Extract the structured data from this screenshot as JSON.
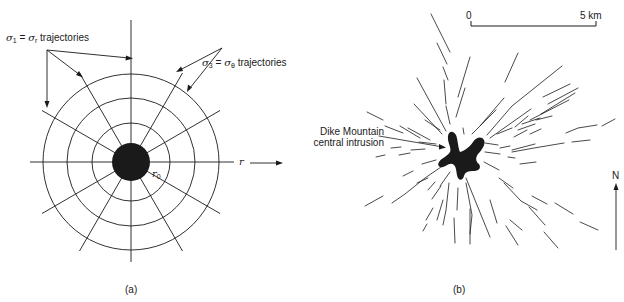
{
  "figure": {
    "panel_a": {
      "caption": "(a)",
      "label_sigma1": {
        "sym1": "σ",
        "sub1": "1",
        "eq": " = ",
        "sym2": "σ",
        "sub2": "r",
        "text": " trajectories"
      },
      "label_sigma3": {
        "sym1": "σ",
        "sub1": "3",
        "eq": " = ",
        "sym2": "σ",
        "sub2": "θ",
        "text": " trajectories"
      },
      "radius_label": {
        "sym": "r",
        "sub": "0"
      },
      "axis_label": "r",
      "geometry": {
        "center": [
          131,
          162
        ],
        "core_radius": 19,
        "circle_radii": [
          39,
          64,
          88
        ],
        "radial_angles_deg": [
          0,
          30,
          60,
          90,
          120,
          150,
          180,
          210,
          240,
          270,
          300,
          330
        ],
        "radial_length": 103
      }
    },
    "panel_b": {
      "caption": "(b)",
      "intrusion_label_line1": "Dike Mountain",
      "intrusion_label_line2": "central intrusion",
      "scale_bar": {
        "start": "0",
        "end": "5 km"
      },
      "north_label": "N"
    },
    "colors": {
      "ink": "#1a1a1a",
      "background": "#ffffff"
    }
  }
}
